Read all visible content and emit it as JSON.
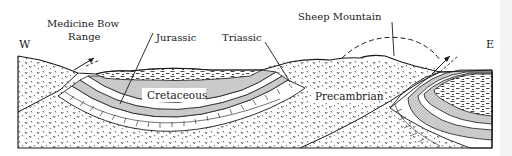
{
  "diagram": {
    "type": "geologic-cross-section",
    "orientation": {
      "west": "W",
      "east": "E"
    },
    "labels": {
      "medicine_bow_line1": "Medicine Bow",
      "medicine_bow_line2": "Range",
      "jurassic": "Jurassic",
      "triassic": "Triassic",
      "sheep_mountain": "Sheep Mountain",
      "cretaceous": "Cretaceous",
      "precambrian": "Precambrian"
    },
    "colors": {
      "ink": "#1a1a1a",
      "cretaceous_gray": "#c9c9c9",
      "background": "#ffffff"
    },
    "symbols": {
      "fault_arrow_west": "thrust-fault-arrow",
      "fault_arrow_east": "thrust-fault-arrow",
      "eroded_fold_outline": "dashed-arc"
    }
  }
}
